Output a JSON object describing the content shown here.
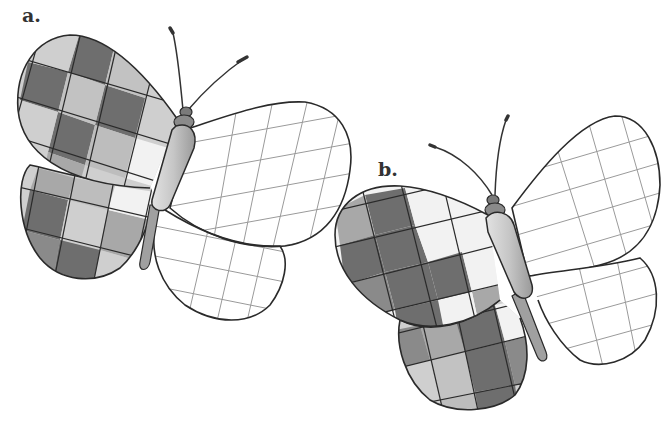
{
  "figure": {
    "panels": [
      {
        "label": "a.",
        "left_wing": "checkered pattern (shades of gray)",
        "right_wing": "empty grid"
      },
      {
        "label": "b.",
        "left_wing": "checkered pattern (shades of gray)",
        "right_wing": "empty grid"
      }
    ]
  },
  "colors": {
    "dark": "#6e6e6e",
    "medium": "#a8a8a8",
    "light": "#cfcfcf",
    "white": "#f7f7f7",
    "outline": "#2a2a2a",
    "grid_line": "#9a9a9a",
    "body": "#c4c4c4"
  }
}
